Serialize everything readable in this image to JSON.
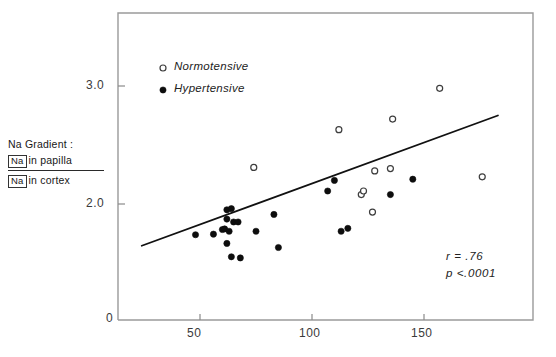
{
  "chart_data": {
    "type": "scatter",
    "title": "",
    "xlabel": "",
    "ylabel": "Na Gradient : [Na] in papilla / [Na] in cortex",
    "ylabel_parts": {
      "title": "Na Gradient :",
      "numerator_box": "Na",
      "numerator_text": "in papilla",
      "denominator_box": "Na",
      "denominator_text": "in cortex"
    },
    "xlim": [
      0,
      185
    ],
    "ylim": [
      0,
      3.5
    ],
    "xticks": [
      50,
      100,
      150
    ],
    "xtick_labels": [
      "50",
      "100",
      "150"
    ],
    "yticks": [
      2.0,
      3.0
    ],
    "ytick_labels": [
      "2.0",
      "3.0"
    ],
    "origin_label": "0",
    "grid": false,
    "legend_position": "upper-left",
    "legend": [
      {
        "label": "Normotensive",
        "marker": "open-circle"
      },
      {
        "label": "Hypertensive",
        "marker": "filled-circle"
      }
    ],
    "annotations": [
      {
        "text": "r = .76"
      },
      {
        "text": "p <.0001"
      }
    ],
    "trendline": {
      "x0": 24,
      "y0": 0.28,
      "x1": 183,
      "y1": 1.75
    },
    "series": [
      {
        "name": "Normotensive",
        "marker": "open-circle",
        "points": [
          [
            74,
            2.31
          ],
          [
            112,
            2.63
          ],
          [
            122,
            2.08
          ],
          [
            123,
            2.11
          ],
          [
            127,
            1.86
          ],
          [
            128,
            2.28
          ],
          [
            135,
            2.3
          ],
          [
            136,
            2.72
          ],
          [
            157,
            2.98
          ],
          [
            176,
            2.23
          ]
        ]
      },
      {
        "name": "Hypertensive",
        "marker": "filled-circle",
        "points": [
          [
            48,
            1.47
          ],
          [
            56,
            1.48
          ],
          [
            60,
            1.56
          ],
          [
            61,
            1.57
          ],
          [
            62,
            1.74
          ],
          [
            62,
            1.9
          ],
          [
            62,
            1.32
          ],
          [
            63,
            1.53
          ],
          [
            64,
            1.92
          ],
          [
            64,
            1.09
          ],
          [
            65,
            1.69
          ],
          [
            67,
            1.69
          ],
          [
            68,
            1.07
          ],
          [
            75,
            1.53
          ],
          [
            83,
            1.82
          ],
          [
            85,
            1.25
          ],
          [
            107,
            2.11
          ],
          [
            110,
            2.2
          ],
          [
            113,
            1.53
          ],
          [
            116,
            1.58
          ],
          [
            135,
            2.08
          ],
          [
            145,
            2.21
          ]
        ]
      }
    ]
  }
}
